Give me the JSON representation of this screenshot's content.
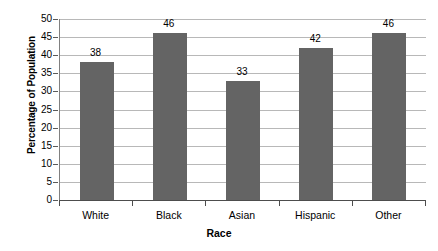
{
  "chart_data": {
    "type": "bar",
    "title": "",
    "subtitle": "",
    "categories": [
      "White",
      "Black",
      "Asian",
      "Hispanic",
      "Other"
    ],
    "values": [
      38,
      46,
      33,
      42,
      46
    ],
    "data_labels": [
      "38",
      "46",
      "33",
      "42",
      "46"
    ],
    "xlabel": "Race",
    "ylabel": "Percentage of Population",
    "ylim": [
      0,
      50
    ],
    "ytick_labels": [
      "50",
      "45",
      "40",
      "35",
      "30",
      "25",
      "20",
      "15",
      "10",
      "5",
      "0"
    ],
    "ytick_values": [
      50,
      45,
      40,
      35,
      30,
      25,
      20,
      15,
      10,
      5,
      0
    ],
    "ytick_step": 5,
    "grid": true,
    "grid_axis": "y",
    "legend": false,
    "legend_position": "none",
    "bar_color": "#646464",
    "grid_color": "#b8b8b8",
    "axis_color": "#4d4d4d",
    "background_color": "#ffffff",
    "text_color": "#000000"
  }
}
